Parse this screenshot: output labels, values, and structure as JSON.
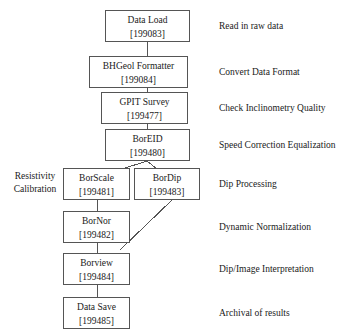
{
  "diagram": {
    "type": "flowchart",
    "orientation": "top-to-bottom",
    "nodes": [
      {
        "id": "data_load",
        "label": "Data Load",
        "code": "[199083]"
      },
      {
        "id": "bhgeol_formatter",
        "label": "BHGeol Formatter",
        "code": "[199084]"
      },
      {
        "id": "gpit_survey",
        "label": "GPIT Survey",
        "code": "[199477]"
      },
      {
        "id": "boreid",
        "label": "BorEID",
        "code": "[199480]"
      },
      {
        "id": "borscale",
        "label": "BorScale",
        "code": "[199481]"
      },
      {
        "id": "bordip",
        "label": "BorDip",
        "code": "[199483]"
      },
      {
        "id": "bornor",
        "label": "BorNor",
        "code": "[199482]"
      },
      {
        "id": "borview",
        "label": "Borview",
        "code": "[199484]"
      },
      {
        "id": "data_save",
        "label": "Data Save",
        "code": "[199485]"
      }
    ],
    "descriptions": [
      {
        "for": "data_load",
        "text": "Read in raw data"
      },
      {
        "for": "bhgeol_formatter",
        "text": "Convert Data Format"
      },
      {
        "for": "gpit_survey",
        "text": "Check Inclinometry Quality"
      },
      {
        "for": "boreid",
        "text": "Speed Correction Equalization"
      },
      {
        "for": "bordip",
        "text": "Dip Processing"
      },
      {
        "for": "bornor",
        "text": "Dynamic Normalization"
      },
      {
        "for": "borview",
        "text": "Dip/Image Interpretation"
      },
      {
        "for": "data_save",
        "text": "Archival of results"
      }
    ],
    "annotation": {
      "line1": "Resistivity",
      "line2": "Calibration"
    },
    "colors": {
      "background": "#ffffff",
      "stroke": "#555555",
      "text": "#1a1a1a"
    }
  }
}
